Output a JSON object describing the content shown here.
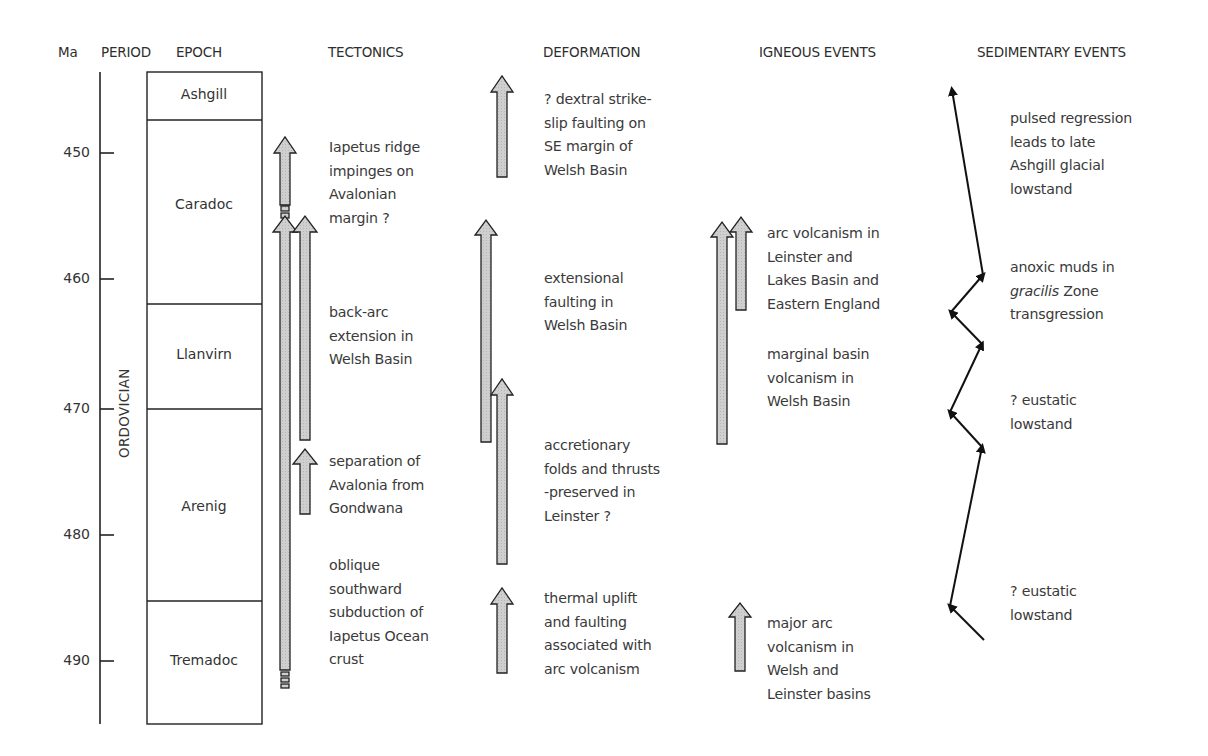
{
  "headers": {
    "ma": "Ma",
    "period": "PERIOD",
    "epoch": "EPOCH",
    "tectonics": "TECTONICS",
    "deformation": "DEFORMATION",
    "igneous": "IGNEOUS EVENTS",
    "sedimentary": "SEDIMENTARY EVENTS"
  },
  "period_label": "ORDOVICIAN",
  "axis": {
    "ticks": [
      {
        "value": "450",
        "y": 153
      },
      {
        "value": "460",
        "y": 279
      },
      {
        "value": "470",
        "y": 409
      },
      {
        "value": "480",
        "y": 535
      },
      {
        "value": "490",
        "y": 661
      }
    ]
  },
  "epochs": [
    {
      "name": "Ashgill",
      "label_y": 86
    },
    {
      "name": "Caradoc",
      "label_y": 196
    },
    {
      "name": "Llanvirn",
      "label_y": 346
    },
    {
      "name": "Arenig",
      "label_y": 498
    },
    {
      "name": "Tremadoc",
      "label_y": 652
    }
  ],
  "tectonics": {
    "notes": [
      "Iapetus ridge\nimpinges on\nAvalonian\nmargin ?",
      "back-arc\nextension in\nWelsh Basin",
      "separation of\nAvalonia from\nGondwana",
      "oblique\nsouthward\nsubduction of\nIapetus Ocean\ncrust"
    ]
  },
  "deformation": {
    "notes": [
      "? dextral strike-\nslip faulting on\nSE margin of\nWelsh Basin",
      "extensional\nfaulting in\nWelsh Basin",
      "accretionary\nfolds and thrusts\n-preserved in\nLeinster ?",
      "thermal uplift\nand faulting\nassociated with\narc volcanism"
    ]
  },
  "igneous": {
    "notes": [
      "arc volcanism in\nLeinster and\nLakes Basin and\nEastern England",
      "marginal basin\nvolcanism in\nWelsh Basin",
      "major arc\nvolcanism in\nWelsh and\nLeinster basins"
    ]
  },
  "sedimentary": {
    "notes": [
      "pulsed regression\nleads to late\nAshgill glacial\nlowstand",
      "anoxic muds in",
      "gracilis",
      " Zone\ntransgression",
      "? eustatic\nlowstand",
      "? eustatic\nlowstand"
    ]
  },
  "colors": {
    "arrow_fill": "#c8c8c8",
    "line": "#111111",
    "text": "#333333"
  }
}
